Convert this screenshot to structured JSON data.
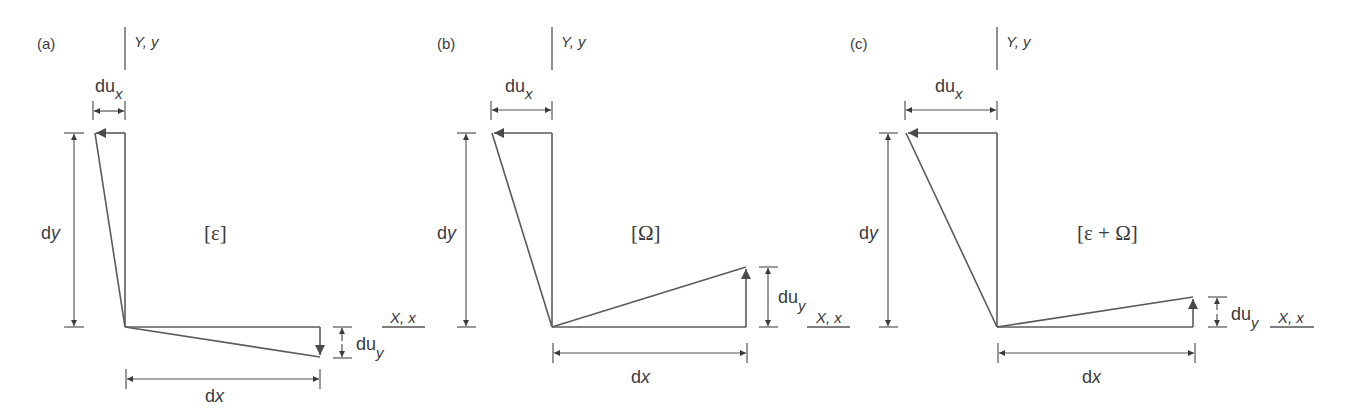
{
  "figure": {
    "panels": [
      {
        "id": "a",
        "panel_label": "(a)",
        "y_axis_label": "Y, y",
        "x_axis_label": "X, x",
        "tensor_label": "[ε]",
        "du_x_label": "du",
        "du_x_sub": "x",
        "du_y_label": "du",
        "du_y_sub": "y",
        "dx_label": "d",
        "dx_var": "x",
        "dy_label": "d",
        "dy_var": "y",
        "description": "Pure strain: top moves left by du_x, right end moves down by du_y"
      },
      {
        "id": "b",
        "panel_label": "(b)",
        "y_axis_label": "Y, y",
        "x_axis_label": "X, x",
        "tensor_label": "[Ω]",
        "du_x_label": "du",
        "du_x_sub": "x",
        "du_y_label": "du",
        "du_y_sub": "y",
        "dx_label": "d",
        "dx_var": "x",
        "dy_label": "d",
        "dy_var": "y",
        "description": "Pure rotation: top moves left by du_x, right end moves up by du_y"
      },
      {
        "id": "c",
        "panel_label": "(c)",
        "y_axis_label": "Y, y",
        "x_axis_label": "X, x",
        "tensor_label": "[ε + Ω]",
        "du_x_label": "du",
        "du_x_sub": "x",
        "du_y_label": "du",
        "du_y_sub": "y",
        "dx_label": "d",
        "dx_var": "x",
        "dy_label": "d",
        "dy_var": "y",
        "description": "Strain plus rotation: top moves left by larger du_x, right end moves up by smaller du_y"
      }
    ],
    "colors": {
      "line": "#5a5a5a",
      "text": "#3a3a3a",
      "background": "#ffffff"
    }
  }
}
